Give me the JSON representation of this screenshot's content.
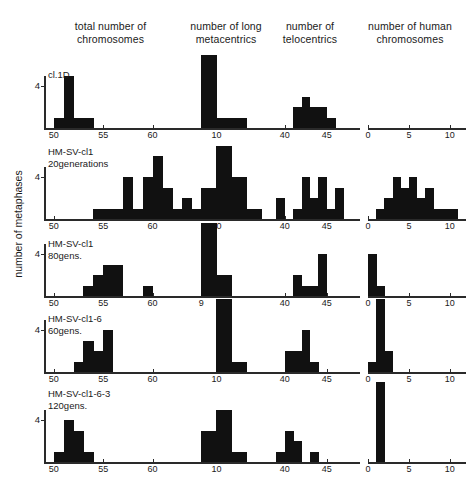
{
  "figure": {
    "ylabel": "number of metaphases",
    "column_titles": [
      "total number of\nchromosomes",
      "number of long\nmetacentrics",
      "number of\ntelocentrics",
      "number of human\nchromosomes"
    ],
    "row_labels": [
      "cl.1D",
      "HM-SV-cl1\n20generations",
      "HM-SV-cl1\n80gens.",
      "HM-SV-cl1-6\n60gens.",
      "HM-SV-cl1-6-3\n120gens."
    ],
    "ytick_label": "4",
    "bar_color": "#111111",
    "axis_color": "#2a2a2a"
  },
  "chart_data": {
    "type": "bar",
    "title": "",
    "ylabel": "number of metaphases",
    "grid": false,
    "legend": "none",
    "panels": [
      {
        "row": "cl.1D",
        "column": "total number of chromosomes",
        "xlabel": "",
        "xlim": [
          49,
          64
        ],
        "ylim": [
          0,
          7
        ],
        "xticks": [
          50,
          55,
          60
        ],
        "yticks": [
          4
        ],
        "x": [
          50,
          51,
          52,
          53
        ],
        "values": [
          1,
          5,
          1,
          1
        ]
      },
      {
        "row": "cl.1D",
        "column": "number of long metacentrics",
        "xlabel": "",
        "xlim": [
          8,
          13
        ],
        "ylim": [
          0,
          7
        ],
        "xticks": [
          10
        ],
        "yticks": [],
        "x": [
          9,
          10,
          11
        ],
        "values": [
          7,
          1,
          1
        ]
      },
      {
        "row": "cl.1D",
        "column": "number of telocentrics",
        "xlabel": "",
        "xlim": [
          38,
          48
        ],
        "ylim": [
          0,
          7
        ],
        "xticks": [
          40,
          45
        ],
        "yticks": [],
        "x": [
          41,
          42,
          43,
          44,
          45
        ],
        "values": [
          2,
          3,
          2,
          2,
          1
        ]
      },
      {
        "row": "cl.1D",
        "column": "number of human chromosomes",
        "xlabel": "",
        "xlim": [
          0,
          11
        ],
        "ylim": [
          0,
          7
        ],
        "xticks": [
          0,
          5,
          10
        ],
        "yticks": [],
        "x": [],
        "values": []
      },
      {
        "row": "HM-SV-cl1 20generations",
        "column": "total number of chromosomes",
        "xlabel": "",
        "xlim": [
          49,
          64
        ],
        "ylim": [
          0,
          7
        ],
        "xticks": [
          50,
          55,
          60
        ],
        "yticks": [
          4
        ],
        "x": [
          54,
          55,
          56,
          57,
          58,
          59,
          60,
          61,
          62,
          63
        ],
        "values": [
          1,
          1,
          1,
          4,
          1,
          4,
          6,
          3,
          1,
          2
        ]
      },
      {
        "row": "HM-SV-cl1 20generations",
        "column": "number of long metacentrics",
        "xlabel": "",
        "xlim": [
          8,
          13
        ],
        "ylim": [
          0,
          7
        ],
        "xticks": [
          10
        ],
        "yticks": [],
        "x": [
          8,
          9,
          10,
          11,
          12
        ],
        "values": [
          1,
          3,
          7,
          4,
          1
        ]
      },
      {
        "row": "HM-SV-cl1 20generations",
        "column": "number of telocentrics",
        "xlabel": "",
        "xlim": [
          38,
          48
        ],
        "ylim": [
          0,
          7
        ],
        "xticks": [
          40,
          45
        ],
        "yticks": [],
        "x": [
          39,
          41,
          42,
          43,
          44,
          45,
          46
        ],
        "values": [
          2,
          1,
          4,
          2,
          4,
          1,
          3
        ],
        "baseline_segments": [
          [
            41,
            47
          ]
        ]
      },
      {
        "row": "HM-SV-cl1 20generations",
        "column": "number of human chromosomes",
        "xlabel": "",
        "xlim": [
          0,
          11
        ],
        "ylim": [
          0,
          7
        ],
        "xticks": [
          0,
          5,
          10
        ],
        "yticks": [],
        "x": [
          1,
          2,
          3,
          4,
          5,
          6,
          7,
          8,
          9,
          10
        ],
        "values": [
          1,
          2,
          4,
          3,
          4,
          2,
          3,
          1,
          1,
          1
        ]
      },
      {
        "row": "HM-SV-cl1 80gens.",
        "column": "total number of chromosomes",
        "xlabel": "",
        "xlim": [
          49,
          64
        ],
        "ylim": [
          0,
          7
        ],
        "xticks": [
          50,
          55,
          60
        ],
        "yticks": [
          4
        ],
        "x": [
          53,
          54,
          55,
          56,
          59
        ],
        "values": [
          1,
          2,
          3,
          3,
          1
        ]
      },
      {
        "row": "HM-SV-cl1 80gens.",
        "column": "number of long metacentrics",
        "xlabel": "",
        "xlim": [
          8,
          13
        ],
        "ylim": [
          0,
          7
        ],
        "xticks": [
          9
        ],
        "yticks": [],
        "x": [
          9,
          10
        ],
        "values": [
          7,
          2
        ]
      },
      {
        "row": "HM-SV-cl1 80gens.",
        "column": "number of telocentrics",
        "xlabel": "",
        "xlim": [
          38,
          48
        ],
        "ylim": [
          0,
          7
        ],
        "xticks": [
          40,
          45
        ],
        "yticks": [],
        "x": [
          41,
          42,
          43,
          44
        ],
        "values": [
          2,
          1,
          1,
          4
        ]
      },
      {
        "row": "HM-SV-cl1 80gens.",
        "column": "number of human chromosomes",
        "xlabel": "",
        "xlim": [
          0,
          11
        ],
        "ylim": [
          0,
          7
        ],
        "xticks": [
          0,
          5,
          10
        ],
        "yticks": [],
        "x": [
          0,
          1
        ],
        "values": [
          4,
          1
        ]
      },
      {
        "row": "HM-SV-cl1-6 60gens.",
        "column": "total number of chromosomes",
        "xlabel": "",
        "xlim": [
          49,
          64
        ],
        "ylim": [
          0,
          7
        ],
        "xticks": [
          50,
          55,
          60
        ],
        "yticks": [
          4
        ],
        "x": [
          52,
          53,
          54,
          55
        ],
        "values": [
          1,
          3,
          2,
          4
        ]
      },
      {
        "row": "HM-SV-cl1-6 60gens.",
        "column": "number of long metacentrics",
        "xlabel": "",
        "xlim": [
          8,
          13
        ],
        "ylim": [
          0,
          7
        ],
        "xticks": [
          10
        ],
        "yticks": [],
        "x": [
          10,
          11
        ],
        "values": [
          7,
          1
        ]
      },
      {
        "row": "HM-SV-cl1-6 60gens.",
        "column": "number of telocentrics",
        "xlabel": "",
        "xlim": [
          38,
          48
        ],
        "ylim": [
          0,
          7
        ],
        "xticks": [
          40,
          45
        ],
        "yticks": [],
        "x": [
          40,
          41,
          42,
          43
        ],
        "values": [
          2,
          2,
          4,
          1
        ]
      },
      {
        "row": "HM-SV-cl1-6 60gens.",
        "column": "number of human chromosomes",
        "xlabel": "",
        "xlim": [
          0,
          11
        ],
        "ylim": [
          0,
          7
        ],
        "xticks": [
          0,
          5,
          10
        ],
        "yticks": [],
        "x": [
          0,
          1,
          2
        ],
        "values": [
          1,
          7,
          2
        ]
      },
      {
        "row": "HM-SV-cl1-6-3 120gens.",
        "column": "total number of chromosomes",
        "xlabel": "",
        "xlim": [
          49,
          64
        ],
        "ylim": [
          0,
          7
        ],
        "xticks": [
          50,
          55,
          60
        ],
        "yticks": [
          4
        ],
        "x": [
          50,
          51,
          52,
          53
        ],
        "values": [
          1,
          4,
          3,
          1
        ]
      },
      {
        "row": "HM-SV-cl1-6-3 120gens.",
        "column": "number of long metacentrics",
        "xlabel": "",
        "xlim": [
          8,
          13
        ],
        "ylim": [
          0,
          7
        ],
        "xticks": [
          10
        ],
        "yticks": [],
        "x": [
          9,
          10,
          11
        ],
        "values": [
          3,
          5,
          1
        ]
      },
      {
        "row": "HM-SV-cl1-6-3 120gens.",
        "column": "number of telocentrics",
        "xlabel": "",
        "xlim": [
          38,
          48
        ],
        "ylim": [
          0,
          7
        ],
        "xticks": [
          40,
          45
        ],
        "yticks": [],
        "x": [
          39,
          40,
          41,
          43
        ],
        "values": [
          1,
          3,
          2,
          1
        ]
      },
      {
        "row": "HM-SV-cl1-6-3 120gens.",
        "column": "number of human chromosomes",
        "xlabel": "",
        "xlim": [
          0,
          11
        ],
        "ylim": [
          0,
          7
        ],
        "xticks": [
          0,
          5,
          10
        ],
        "yticks": [],
        "x": [
          1
        ],
        "values": [
          9
        ]
      }
    ]
  }
}
